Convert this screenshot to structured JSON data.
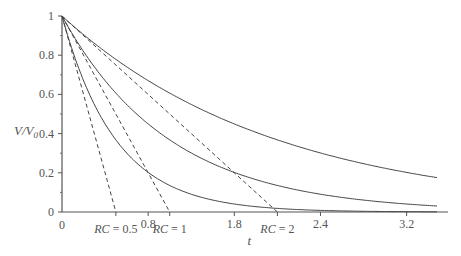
{
  "chart_data": {
    "type": "line",
    "title": "",
    "xlabel": "t",
    "ylabel": "V/V0",
    "ylabel_main": "V/V",
    "ylabel_sub": "0",
    "xlim": [
      0,
      3.5
    ],
    "ylim": [
      0,
      1
    ],
    "grid": false,
    "y_ticks": [
      {
        "value": 0,
        "label": "0"
      },
      {
        "value": 0.2,
        "label": "0.2"
      },
      {
        "value": 0.4,
        "label": "0.4"
      },
      {
        "value": 0.6,
        "label": "0.6"
      },
      {
        "value": 0.8,
        "label": "0.8"
      },
      {
        "value": 1,
        "label": "1"
      }
    ],
    "y_minor_ticks": [
      0.1,
      0.3,
      0.5,
      0.7,
      0.9
    ],
    "x_ticks": [
      {
        "value": 0,
        "label": "0"
      },
      {
        "value": 0.5,
        "label": "RC = 0.5",
        "italic_prefix": "RC"
      },
      {
        "value": 0.8,
        "label": "0.8"
      },
      {
        "value": 1,
        "label": "RC = 1",
        "italic_prefix": "RC"
      },
      {
        "value": 1.6,
        "label": "1.8"
      },
      {
        "value": 2,
        "label": "RC = 2",
        "italic_prefix": "RC"
      },
      {
        "value": 2.4,
        "label": "2.4"
      },
      {
        "value": 3.2,
        "label": "3.2"
      }
    ],
    "series": [
      {
        "name": "RC = 0.5",
        "style": "solid",
        "function": "exp(-t/0.5)",
        "rc": 0.5
      },
      {
        "name": "RC = 1",
        "style": "solid",
        "function": "exp(-t/1)",
        "rc": 1
      },
      {
        "name": "RC = 2",
        "style": "solid",
        "function": "exp(-t/2)",
        "rc": 2
      },
      {
        "name": "Tangent RC = 0.5",
        "style": "dashed",
        "function": "1 - t/0.5",
        "rc": 0.5
      },
      {
        "name": "Tangent RC = 1",
        "style": "dashed",
        "function": "1 - t/1",
        "rc": 1
      },
      {
        "name": "Tangent RC = 2",
        "style": "dashed",
        "function": "1 - t/2",
        "rc": 2
      }
    ],
    "sample_points": {
      "t": [
        0,
        0.5,
        1,
        1.5,
        2,
        2.5,
        3,
        3.5
      ],
      "RC_0.5": [
        1,
        0.368,
        0.135,
        0.05,
        0.018,
        0.007,
        0.002,
        0.001
      ],
      "RC_1": [
        1,
        0.607,
        0.368,
        0.223,
        0.135,
        0.082,
        0.05,
        0.03
      ],
      "RC_2": [
        1,
        0.779,
        0.607,
        0.472,
        0.368,
        0.287,
        0.223,
        0.174
      ]
    },
    "colors": {
      "axis": "#555555",
      "curve": "#444444",
      "text": "#555555"
    }
  }
}
